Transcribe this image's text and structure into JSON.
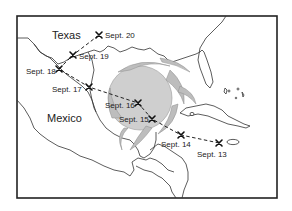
{
  "map": {
    "title": "",
    "regions": [
      {
        "name": "Texas",
        "x": 52,
        "y": 39
      },
      {
        "name": "Mexico",
        "x": 47,
        "y": 122
      }
    ],
    "track": [
      {
        "label": "Sept. 13",
        "x": 219,
        "y": 143,
        "lx": 197,
        "ly": 157
      },
      {
        "label": "Sept. 14",
        "x": 181,
        "y": 135,
        "lx": 161,
        "ly": 147
      },
      {
        "label": "Sept. 15",
        "x": 152,
        "y": 119,
        "lx": 119,
        "ly": 122
      },
      {
        "label": "Sept. 16",
        "x": 138,
        "y": 103,
        "lx": 105,
        "ly": 108
      },
      {
        "label": "Sept. 17",
        "x": 89,
        "y": 87,
        "lx": 52,
        "ly": 92
      },
      {
        "label": "Sept. 18",
        "x": 59,
        "y": 69,
        "lx": 26,
        "ly": 74
      },
      {
        "label": "Sept. 19",
        "x": 73,
        "y": 55,
        "lx": 79,
        "ly": 59
      },
      {
        "label": "Sept. 20",
        "x": 99,
        "y": 35,
        "lx": 105,
        "ly": 38
      }
    ],
    "colors": {
      "storm": "#cfcfcf",
      "line": "#222222",
      "background": "#ffffff"
    }
  }
}
